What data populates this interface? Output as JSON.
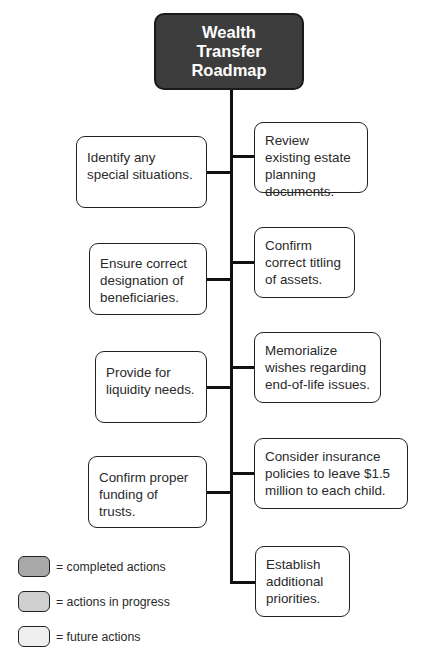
{
  "title": "Wealth Transfer Roadmap",
  "root": {
    "lines": [
      "Wealth",
      "Transfer",
      "Roadmap"
    ],
    "color": "#3d3d3d"
  },
  "left_items": [
    {
      "text": "Identify any special situations."
    },
    {
      "text": "Ensure correct designation of beneficiaries."
    },
    {
      "text": "Provide for liquidity needs."
    },
    {
      "text": "Confirm proper funding of trusts."
    }
  ],
  "right_items": [
    {
      "text": "Review existing estate planning documents."
    },
    {
      "text": "Confirm correct titling of assets."
    },
    {
      "text": "Memorialize wishes regarding end-of-life issues."
    },
    {
      "text": "Consider insurance policies to leave $1.5 million to each child."
    },
    {
      "text": "Establish additional priorities."
    }
  ],
  "legend": [
    {
      "label": "= completed actions",
      "color": "#a8a8a8"
    },
    {
      "label": "= actions in progress",
      "color": "#cfcfcf"
    },
    {
      "label": "= future actions",
      "color": "#efefef"
    }
  ]
}
